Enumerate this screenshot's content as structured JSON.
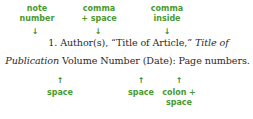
{
  "annotations_top": [
    {
      "id": "note-number",
      "lines": [
        "note",
        "number"
      ],
      "arrow": "↓"
    },
    {
      "id": "comma-space",
      "lines": [
        "comma",
        "+ space"
      ],
      "arrow": "↓"
    },
    {
      "id": "comma-inside",
      "lines": [
        "comma",
        "inside"
      ],
      "arrow": "↓"
    }
  ],
  "annotations_bottom": [
    {
      "id": "space-1",
      "lines": [
        "space"
      ],
      "arrow": "↑"
    },
    {
      "id": "space-2",
      "lines": [
        "space"
      ],
      "arrow": "↑"
    },
    {
      "id": "colon-space",
      "lines": [
        "colon +",
        "space"
      ],
      "arrow": "↑"
    }
  ],
  "citation": {
    "line1_plain": "1. Author(s), “Title of Article,” ",
    "line1_italic": "Title of",
    "line2_italic": "Publication",
    "line2_plain": " Volume Number (Date): Page numbers."
  },
  "colors": {
    "annotation": "#4a9a2e",
    "text": "#2a2a2a"
  }
}
